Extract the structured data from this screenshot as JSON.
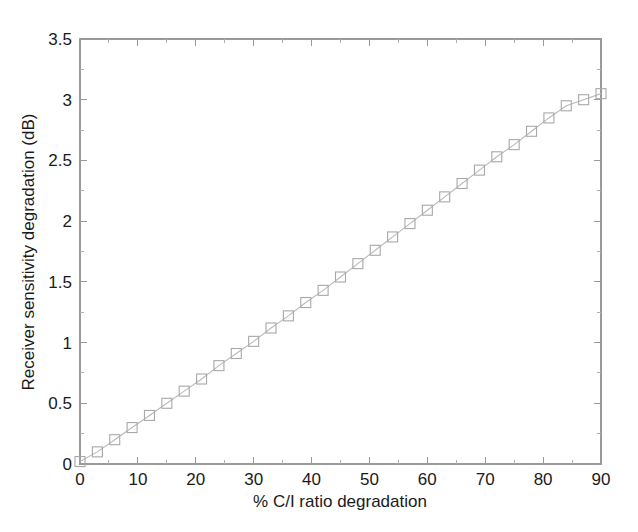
{
  "figure": {
    "background": "#ffffff",
    "plot_area": {
      "left": 80,
      "top": 39,
      "right": 601,
      "bottom": 464
    }
  },
  "chart_data": {
    "type": "line",
    "title": "",
    "subtitle": "",
    "xlabel": "% C/I ratio degradation",
    "ylabel": "Receiver sensitivity degradation (dB)",
    "xlim": [
      0,
      90
    ],
    "ylim": [
      0,
      3.5
    ],
    "xticks": [
      0,
      10,
      20,
      30,
      40,
      50,
      60,
      70,
      80,
      90
    ],
    "xticklabels": [
      "0",
      "10",
      "20",
      "30",
      "40",
      "50",
      "60",
      "70",
      "80",
      "90"
    ],
    "yticks": [
      0,
      0.5,
      1,
      1.5,
      2,
      2.5,
      3,
      3.5
    ],
    "yticklabels": [
      "0",
      "0.5",
      "1",
      "1.5",
      "2",
      "2.5",
      "3",
      "3.5"
    ],
    "grid": false,
    "legend": null,
    "marker": "square-open",
    "marker_color": "#a8a8a8",
    "line_color": "#b9b9b9",
    "box_style": true,
    "tick_direction": "in",
    "x": [
      0,
      3,
      6,
      9,
      12,
      15,
      18,
      21,
      24,
      27,
      30,
      33,
      36,
      39,
      42,
      45,
      48,
      51,
      54,
      57,
      60,
      63,
      66,
      69,
      72,
      75,
      78,
      81,
      84,
      87,
      90
    ],
    "y": [
      0.02,
      0.1,
      0.2,
      0.3,
      0.4,
      0.5,
      0.6,
      0.7,
      0.81,
      0.91,
      1.01,
      1.12,
      1.22,
      1.33,
      1.43,
      1.54,
      1.65,
      1.76,
      1.87,
      1.98,
      2.09,
      2.2,
      2.31,
      2.42,
      2.53,
      2.63,
      2.74,
      2.85,
      2.95,
      3.0,
      3.05
    ],
    "series": [
      {
        "name": "Receiver sensitivity degradation",
        "values": [
          0.02,
          0.1,
          0.2,
          0.3,
          0.4,
          0.5,
          0.6,
          0.7,
          0.81,
          0.91,
          1.01,
          1.12,
          1.22,
          1.33,
          1.43,
          1.54,
          1.65,
          1.76,
          1.87,
          1.98,
          2.09,
          2.2,
          2.31,
          2.42,
          2.53,
          2.63,
          2.74,
          2.85,
          2.95,
          3.0,
          3.05
        ]
      }
    ]
  }
}
